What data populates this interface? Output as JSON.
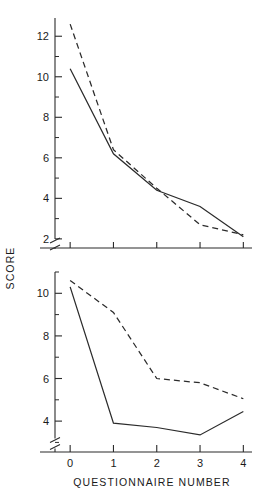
{
  "figure": {
    "name": "score-vs-questionnaire-number-figure",
    "background_color": "#ffffff",
    "line_color": "#2b2b2b"
  },
  "axis_titles": {
    "x": "QUESTIONNAIRE  NUMBER",
    "y": "SCORE"
  },
  "chart_data": [
    {
      "type": "line",
      "panel": "upper",
      "title": "",
      "subtitle": "",
      "xlabel": "",
      "ylabel": "SCORE",
      "x": [
        0,
        1,
        2,
        3,
        4
      ],
      "xtick_labels": [
        "0",
        "1",
        "2",
        "3",
        "4"
      ],
      "xlim": [
        -0.35,
        4.2
      ],
      "ylim": [
        1.55,
        12.9
      ],
      "ytick_labels": [
        "2",
        "4",
        "6",
        "8",
        "10",
        "12"
      ],
      "yticks": [
        2,
        4,
        6,
        8,
        10,
        12
      ],
      "yminor_ticks": [
        3,
        5,
        7,
        9,
        11,
        13
      ],
      "y_axis_break": true,
      "y_axis_break_value": 1.75,
      "grid": false,
      "legend": "none",
      "series": [
        {
          "name": "solid-series",
          "style": "solid",
          "values": [
            10.4,
            6.2,
            4.4,
            3.6,
            2.1
          ]
        },
        {
          "name": "dashed-series",
          "style": "dashed",
          "values": [
            12.6,
            6.4,
            4.5,
            2.7,
            2.2
          ]
        }
      ]
    },
    {
      "type": "line",
      "panel": "lower",
      "title": "",
      "subtitle": "",
      "xlabel": "QUESTIONNAIRE  NUMBER",
      "ylabel": "SCORE",
      "x": [
        0,
        1,
        2,
        3,
        4
      ],
      "xtick_labels": [
        "0",
        "1",
        "2",
        "3",
        "4"
      ],
      "xlim": [
        -0.35,
        4.2
      ],
      "ylim": [
        2.55,
        11.0
      ],
      "ytick_labels": [
        "4",
        "6",
        "8",
        "10"
      ],
      "yticks": [
        4,
        6,
        8,
        10
      ],
      "yminor_ticks": [
        3,
        5,
        7,
        9,
        11
      ],
      "y_axis_break": true,
      "y_axis_break_value": 2.95,
      "grid": false,
      "legend": "none",
      "series": [
        {
          "name": "solid-series",
          "style": "solid",
          "values": [
            10.3,
            3.9,
            3.7,
            3.35,
            4.45
          ]
        },
        {
          "name": "dashed-series",
          "style": "dashed",
          "values": [
            10.6,
            9.1,
            6.0,
            5.8,
            5.05
          ]
        }
      ]
    }
  ]
}
